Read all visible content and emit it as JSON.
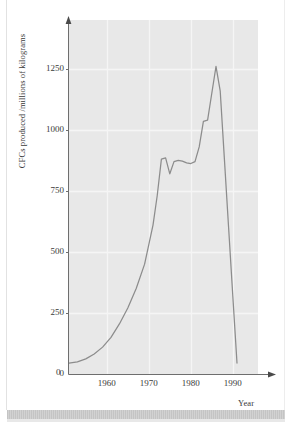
{
  "figure": {
    "kind": "line-chart-scan",
    "background_color": "#ffffff",
    "plot_background_color": "#e8e8e8",
    "grid_color": "#f5f5f5",
    "line_color": "#8c8c8c",
    "axis_color": "#6e6e6e",
    "text_color": "#3a3a3a"
  },
  "chart_data": {
    "type": "line",
    "title": "",
    "subtitle": "",
    "xlabel": "Year",
    "ylabel": "CFCs produced /millions of kilograms",
    "xlim": [
      1951,
      1996
    ],
    "ylim": [
      0,
      1450
    ],
    "xticks": [
      1960,
      1970,
      1980,
      1990
    ],
    "xtick_labels": [
      "1960",
      "1970",
      "1980",
      "1990"
    ],
    "yticks": [
      0,
      250,
      500,
      750,
      1000,
      1250
    ],
    "ytick_labels": [
      "0",
      "250",
      "500",
      "750",
      "1000",
      "1250"
    ],
    "grid": true,
    "grid_axes": "both",
    "legend": "none",
    "annotations": [],
    "series": [
      {
        "name": "CFCs produced",
        "units": "millions of kilograms",
        "x": [
          1951,
          1953,
          1955,
          1957,
          1959,
          1961,
          1963,
          1965,
          1967,
          1969,
          1971,
          1972,
          1973,
          1974,
          1975,
          1976,
          1977,
          1978,
          1979,
          1980,
          1981,
          1982,
          1983,
          1984,
          1985,
          1986,
          1987,
          1988,
          1989,
          1990,
          1991
        ],
        "y": [
          45,
          50,
          62,
          82,
          110,
          150,
          205,
          270,
          350,
          450,
          610,
          730,
          880,
          885,
          820,
          870,
          875,
          872,
          865,
          862,
          870,
          930,
          1035,
          1040,
          1150,
          1260,
          1160,
          880,
          600,
          320,
          45
        ],
        "peak": {
          "year": 1986,
          "value": 1260
        },
        "plateau": {
          "start_year": 1973,
          "end_year": 1981,
          "approx_value": 870
        },
        "start": {
          "year": 1951,
          "value": 45
        },
        "end": {
          "year": 1991,
          "value": 45
        }
      }
    ]
  }
}
